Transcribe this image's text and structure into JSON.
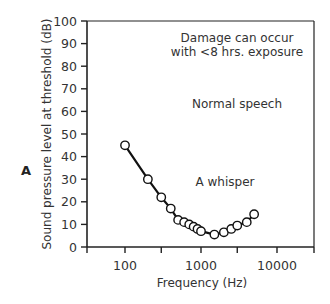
{
  "panel_label": "A",
  "chart_data": {
    "type": "line",
    "title": "",
    "xlabel": "Frequency (Hz)",
    "ylabel": "Sound pressure level at threshold (dB)",
    "xscale": "log",
    "xlim": [
      40,
      25000
    ],
    "ylim": [
      0,
      100
    ],
    "x_ticks": [
      100,
      1000,
      10000
    ],
    "x_tick_labels": [
      "100",
      "1000",
      "10000"
    ],
    "y_ticks": [
      0,
      10,
      20,
      30,
      40,
      50,
      60,
      70,
      80,
      90,
      100
    ],
    "y_tick_labels": [
      "0",
      "10",
      "20",
      "30",
      "40",
      "50",
      "60",
      "70",
      "80",
      "90",
      "100"
    ],
    "grid": false,
    "series": [
      {
        "name": "Hearing threshold",
        "marker": "open-circle",
        "x": [
          100,
          200,
          300,
          400,
          500,
          600,
          700,
          800,
          900,
          1000,
          1500,
          2000,
          2500,
          3000,
          4000,
          5000
        ],
        "y": [
          45,
          30,
          22,
          17,
          12,
          11,
          10,
          9,
          8,
          7,
          5.5,
          6.5,
          8,
          9.5,
          11,
          14.5
        ]
      }
    ],
    "annotations": [
      {
        "text": "Damage can occur",
        "x": 1500,
        "y": 93
      },
      {
        "text": "with <8 hrs. exposure",
        "x": 1500,
        "y": 87
      },
      {
        "text": "Normal speech",
        "x": 1500,
        "y": 60
      },
      {
        "text": "A whisper",
        "x": 1000,
        "y": 28
      }
    ]
  }
}
